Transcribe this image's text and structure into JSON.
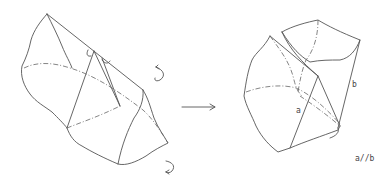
{
  "diagram": {
    "type": "geometric-transformation",
    "left_figure": {
      "description": "irregular solid with inscribed triangular cut and right-angle markers",
      "rotation_arrows": [
        "rotate-top",
        "rotate-bottom"
      ]
    },
    "arrow": "transform-arrow",
    "right_figure": {
      "description": "rotated solid showing two parallel edges",
      "edge_labels": {
        "a": "a",
        "b": "b"
      }
    },
    "caption": "a//b",
    "stroke_color": "#555555"
  }
}
